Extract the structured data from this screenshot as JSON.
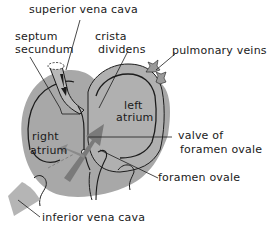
{
  "diagram": {
    "labels": {
      "superior_vena_cava": "superior vena cava",
      "septum_secundum_line1": "septum",
      "septum_secundum_line2": "secundum",
      "crista_dividens_line1": "crista",
      "crista_dividens_line2": "dividens",
      "pulmonary_veins": "pulmonary veins",
      "left_atrium_line1": "left",
      "left_atrium_line2": "atrium",
      "right_atrium_line1": "right",
      "right_atrium_line2": "atrium",
      "valve_line1": "valve of",
      "valve_line2": "foramen ovale",
      "foramen_ovale": "foramen ovale",
      "inferior_vena_cava": "inferior vena cava"
    },
    "colors": {
      "tissue": "#a9a9a9",
      "tissue_light": "#bdbdbd",
      "outline": "#1c1c1c",
      "arrow": "#7a7a7a",
      "background": "#ffffff"
    }
  }
}
